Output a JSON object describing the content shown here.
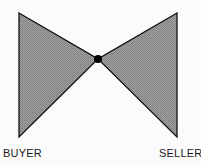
{
  "diagram": {
    "type": "bow-tie",
    "labels": {
      "left": "BUYER",
      "right": "SELLER"
    },
    "colors": {
      "fill": "#9a9a9a",
      "fill_dark": "#7f7f7f",
      "fill_light": "#b8b8b8",
      "stroke": "#111111",
      "node": "#000000",
      "background": "#fbfbfb"
    }
  }
}
